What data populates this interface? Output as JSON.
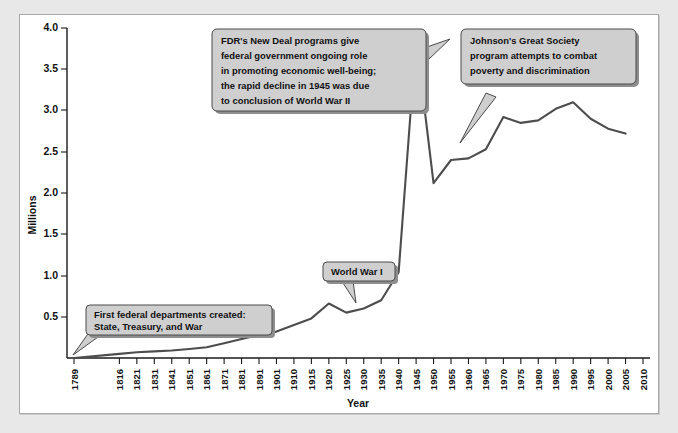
{
  "chart_data": {
    "type": "line",
    "title": "",
    "xlabel": "Year",
    "ylabel": "Millions",
    "ylim": [
      0,
      4.0
    ],
    "grid": false,
    "legend": "none",
    "y_ticks": [
      "0.5",
      "1.0",
      "1.5",
      "2.0",
      "2.5",
      "3.0",
      "3.5",
      "4.0"
    ],
    "y_tick_values": [
      0.5,
      1.0,
      1.5,
      2.0,
      2.5,
      3.0,
      3.5,
      4.0
    ],
    "x_tick_labels": [
      "1789",
      "1816",
      "1821",
      "1831",
      "1841",
      "1851",
      "1861",
      "1871",
      "1881",
      "1891",
      "1901",
      "1910",
      "1915",
      "1920",
      "1925",
      "1930",
      "1935",
      "1940",
      "1945",
      "1950",
      "1955",
      "1960",
      "1965",
      "1970",
      "1975",
      "1980",
      "1985",
      "1990",
      "1995",
      "2000",
      "2005",
      "2010"
    ],
    "series": [
      {
        "name": "Federal civilian employment",
        "x": [
          1789,
          1816,
          1821,
          1831,
          1841,
          1851,
          1861,
          1871,
          1881,
          1891,
          1901,
          1910,
          1915,
          1920,
          1925,
          1930,
          1935,
          1940,
          1945,
          1950,
          1955,
          1960,
          1965,
          1970,
          1975,
          1980,
          1985,
          1990,
          1995,
          2000,
          2005
        ],
        "values": [
          0.0,
          0.05,
          0.07,
          0.08,
          0.09,
          0.11,
          0.13,
          0.18,
          0.23,
          0.28,
          0.32,
          0.4,
          0.48,
          0.66,
          0.55,
          0.6,
          0.7,
          1.04,
          3.87,
          2.12,
          2.4,
          2.42,
          2.53,
          2.92,
          2.85,
          2.88,
          3.02,
          3.1,
          2.9,
          2.78,
          2.72
        ]
      }
    ],
    "annotations": [
      {
        "id": "first-federal-departments",
        "text_lines": [
          "First federal departments created:",
          "State, Treasury, and War"
        ],
        "points_to_year": 1789,
        "points_to_value": 0.0
      },
      {
        "id": "world-war-one",
        "text_lines": [
          "World War I"
        ],
        "points_to_year": 1918,
        "points_to_value": 0.66
      },
      {
        "id": "fdr-new-deal",
        "text_lines": [
          "FDR's New Deal programs give",
          "federal government ongoing role",
          "in promoting economic well-being;",
          "the rapid decline in 1945 was due",
          "to conclusion of World War II"
        ],
        "points_to_year": 1945,
        "points_to_value": 3.87
      },
      {
        "id": "johnson-great-society",
        "text_lines": [
          "Johnson's Great Society",
          "program attempts to combat",
          "poverty and discrimination"
        ],
        "points_to_year": 1965,
        "points_to_value": 2.53
      }
    ],
    "colors": {
      "line": "#4d4d4d",
      "axis": "#1a1a1a",
      "callout_fill": "#cfcfcf",
      "callout_border": "#4a4a4a",
      "panel_background": "#ffffff",
      "page_background": "#e8e8e8"
    }
  }
}
